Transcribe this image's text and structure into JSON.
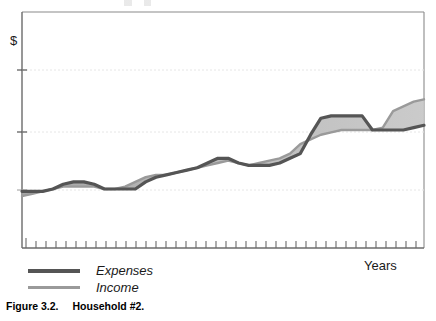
{
  "figure": {
    "caption_number": "Figure 3.2.",
    "caption_title": "Household #2."
  },
  "axes": {
    "ylabel": "$",
    "xlabel": "Years"
  },
  "legend": {
    "items": [
      {
        "label": "Expenses",
        "color": "#555555",
        "swatch_name": "expenses-swatch"
      },
      {
        "label": "Income",
        "color": "#9a9a9a",
        "swatch_name": "income-swatch"
      }
    ]
  },
  "colors": {
    "expenses_line": "#555555",
    "income_line": "#9a9a9a",
    "fill_band": "#b9b9b9",
    "axis": "#6b6b6b",
    "gridline": "#e4e4e4",
    "frame": "#8a8a8a",
    "text": "#1a1a1a"
  },
  "chart_data": {
    "type": "line",
    "title": "Household #2.",
    "xlabel": "Years",
    "ylabel": "$",
    "grid": true,
    "legend_position": "below-left",
    "x_axis": {
      "tick_count": 40,
      "tick_labels": [],
      "note": "unlabeled evenly spaced year ticks"
    },
    "y_axis": {
      "tick_count": 3,
      "tick_labels": [],
      "note": "three unlabeled horizontal gridlines; dollar scale only"
    },
    "x": [
      0,
      1,
      2,
      3,
      4,
      5,
      6,
      7,
      8,
      9,
      10,
      11,
      12,
      13,
      14,
      15,
      16,
      17,
      18,
      19,
      20,
      21,
      22,
      23,
      24,
      25,
      26,
      27,
      28,
      29,
      30,
      31,
      32,
      33,
      34,
      35,
      36,
      37,
      38,
      39
    ],
    "series": [
      {
        "name": "Expenses",
        "color": "#555555",
        "values": [
          24,
          24,
          24,
          25,
          27,
          28,
          28,
          27,
          25,
          25,
          25,
          25,
          28,
          30,
          31,
          32,
          33,
          34,
          36,
          38,
          38,
          36,
          35,
          35,
          35,
          36,
          38,
          40,
          48,
          55,
          56,
          56,
          56,
          56,
          50,
          50,
          50,
          50,
          51,
          52
        ]
      },
      {
        "name": "Income",
        "color": "#9a9a9a",
        "values": [
          22,
          23,
          24,
          25,
          26,
          26,
          26,
          26,
          25,
          25,
          26,
          28,
          30,
          31,
          31,
          32,
          33,
          34,
          35,
          36,
          37,
          36,
          35,
          36,
          37,
          38,
          40,
          44,
          46,
          48,
          49,
          50,
          50,
          50,
          50,
          51,
          58,
          60,
          62,
          63
        ]
      }
    ],
    "annotations": [
      "Expenses spike above income near the final quarter, then fall back below the rising income line at the end."
    ]
  }
}
